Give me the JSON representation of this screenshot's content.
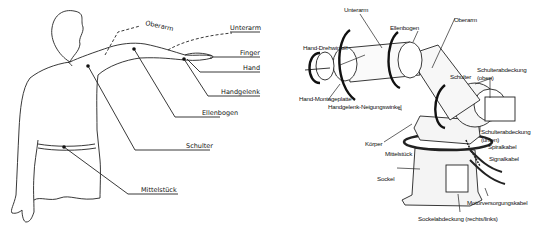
{
  "human_figure": {
    "labels": {
      "oberarm": "Oberarm",
      "unterarm": "Unterarm",
      "finger": "Finger",
      "hand": "Hand",
      "handgelenk": "Handgelenk",
      "ellenbogen": "Ellenbogen",
      "schulter": "Schulter",
      "mittelstueck": "Mittelstück"
    }
  },
  "robot_arm": {
    "labels": {
      "unterarm": "Unterarm",
      "ellenbogen": "Ellenbogen",
      "oberarm": "Oberarm",
      "hand_drehwinkel": "Hand-Drehwinkel",
      "schulter": "Schulter",
      "schulterabdeckung_oben_1": "Schulterabdeckung",
      "schulterabdeckung_oben_2": "(oben)",
      "hand_montageplatte": "Hand-Montageplatte",
      "handgelenk_neigungswinkel": "Handgelenk-Neigungswinkel",
      "schulterabdeckung_unten_1": "Schulterabdeckung",
      "schulterabdeckung_unten_2": "(unten)",
      "koerper": "Körper",
      "spiralkabel": "Spiralkabel",
      "mittelstueck": "Mittelstück",
      "signalkabel": "Signalkabel",
      "sockel": "Sockel",
      "motorversorgungskabel": "Motorversorgungskabel",
      "sockelabdeckung": "Sockelabdeckung (rechts/links)"
    }
  }
}
